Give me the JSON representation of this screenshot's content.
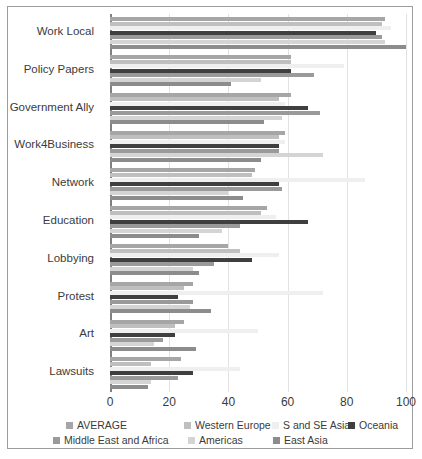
{
  "chart_data": {
    "type": "bar",
    "orientation": "horizontal",
    "title": "",
    "xlabel": "",
    "ylabel": "",
    "xlim": [
      0,
      100
    ],
    "xticks": [
      0,
      20,
      40,
      60,
      80,
      100
    ],
    "grid": true,
    "legend_position": "bottom",
    "categories": [
      "Work Local",
      "Policy Papers",
      "Government Ally",
      "Work4Business",
      "Network",
      "Education",
      "Lobbying",
      "Protest",
      "Art",
      "Lawsuits"
    ],
    "series": [
      {
        "name": "AVERAGE",
        "color": "#a6a6a6",
        "values": [
          93,
          61,
          61,
          59,
          49,
          53,
          40,
          28,
          25,
          24
        ]
      },
      {
        "name": "Western Europe",
        "color": "#bfbfbf",
        "values": [
          92,
          61,
          57,
          57,
          48,
          51,
          44,
          25,
          22,
          14
        ]
      },
      {
        "name": "S and SE Asia",
        "color": "#efefef",
        "values": [
          95,
          79,
          59,
          59,
          86,
          56,
          57,
          72,
          50,
          44
        ]
      },
      {
        "name": "Oceania",
        "color": "#3f3f3f",
        "values": [
          90,
          61,
          67,
          57,
          57,
          67,
          48,
          23,
          22,
          28
        ]
      },
      {
        "name": "Middle East and Africa",
        "color": "#9a9a9a",
        "values": [
          92,
          69,
          71,
          57,
          58,
          44,
          35,
          28,
          18,
          23
        ]
      },
      {
        "name": "Americas",
        "color": "#d4d4d4",
        "values": [
          93,
          51,
          58,
          72,
          40,
          38,
          28,
          27,
          15,
          14
        ]
      },
      {
        "name": "East Asia",
        "color": "#8c8c8c",
        "values": [
          100,
          41,
          52,
          51,
          45,
          30,
          30,
          34,
          29,
          13
        ]
      }
    ]
  },
  "axis": {
    "tick_labels": [
      "0",
      "20",
      "40",
      "60",
      "80",
      "100"
    ]
  },
  "legend": {
    "items": [
      {
        "label": "AVERAGE"
      },
      {
        "label": "Western Europe"
      },
      {
        "label": "S and SE Asia"
      },
      {
        "label": "Oceania"
      },
      {
        "label": "Middle East and Africa"
      },
      {
        "label": "Americas"
      },
      {
        "label": "East Asia"
      }
    ]
  }
}
